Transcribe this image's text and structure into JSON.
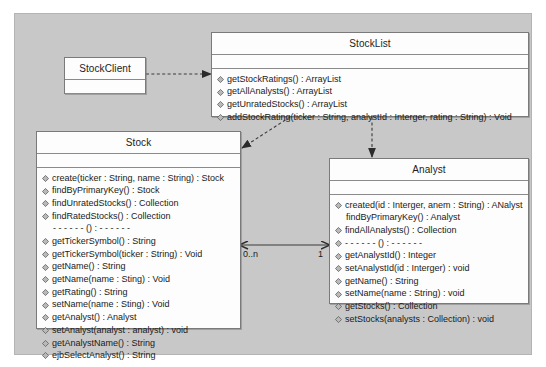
{
  "diagram": {
    "type": "uml-class-diagram",
    "canvas_color": "#c8c8c8",
    "class_fill_color": "#fdfdfd",
    "border_color": "#7a7a7a",
    "line_color": "#4a4a4a"
  },
  "classes": {
    "stock_client": {
      "name": "StockClient",
      "attributes": [],
      "operations": []
    },
    "stock_list": {
      "name": "StockList",
      "attributes": [],
      "operations": [
        {
          "icon": "public-method-icon",
          "label": "getStockRatings() : ArrayList"
        },
        {
          "icon": "public-method-icon",
          "label": "getAllAnalysts() : ArrayList"
        },
        {
          "icon": "public-method-icon",
          "label": "getUnratedStocks() : ArrayList"
        },
        {
          "icon": "public-method-icon",
          "label": "addStockRating(ticker : String, analystId : Interger, rating : String) : Void"
        }
      ]
    },
    "stock": {
      "name": "Stock",
      "attributes": [],
      "operations": [
        {
          "icon": "public-method-icon",
          "label": "create(ticker : String, name : String) : Stock"
        },
        {
          "icon": "public-method-icon",
          "label": "findByPrimaryKey() : Stock"
        },
        {
          "icon": "public-method-icon",
          "label": "findUnratedStocks() : Collection"
        },
        {
          "icon": "public-method-icon",
          "label": "findRatedStocks() : Collection"
        },
        {
          "icon": "none",
          "label": "- - - - - - () : - - - - - -"
        },
        {
          "icon": "public-method-icon",
          "label": "getTickerSymbol() : String"
        },
        {
          "icon": "public-method-icon",
          "label": "getTickerSymbol(ticker : String) : Void"
        },
        {
          "icon": "public-method-icon",
          "label": "getName() : String"
        },
        {
          "icon": "public-method-icon",
          "label": "getName(name : Sting) : Void"
        },
        {
          "icon": "public-method-icon",
          "label": "getRating() : String"
        },
        {
          "icon": "public-method-icon",
          "label": "setName(name : Sting) : Void"
        },
        {
          "icon": "public-method-icon",
          "label": "getAnalyst() : Analyst"
        },
        {
          "icon": "public-method-icon",
          "label": "setAnalyst(analyst : analyst) : void"
        },
        {
          "icon": "public-method-icon",
          "label": "getAnalystName() : String"
        },
        {
          "icon": "public-method-icon",
          "label": "ejbSelectAnalyst() : String"
        }
      ]
    },
    "analyst": {
      "name": "Analyst",
      "attributes": [],
      "operations": [
        {
          "icon": "public-method-icon",
          "label": "created(id : Interger, anem : String) : ANalyst"
        },
        {
          "icon": "none",
          "label": "findByPrimaryKey() : Analyst"
        },
        {
          "icon": "public-method-icon",
          "label": "findAllAnalysts() : Collection"
        },
        {
          "icon": "public-method-icon",
          "label": "- - - - - - () : - - - - - -"
        },
        {
          "icon": "public-method-icon",
          "label": "getAnalystId() : Integer"
        },
        {
          "icon": "public-method-icon",
          "label": "setAnalystId(id : Interger) : void"
        },
        {
          "icon": "public-method-icon",
          "label": "getName() : String"
        },
        {
          "icon": "public-method-icon",
          "label": "setName(name : String) : void"
        },
        {
          "icon": "public-method-icon",
          "label": "getStocks() : Collection"
        },
        {
          "icon": "public-method-icon",
          "label": "setStocks(analysts : Collection) : void"
        }
      ]
    }
  },
  "relationships": {
    "client_to_list": {
      "style": "dependency-dashed-arrow"
    },
    "list_to_stock": {
      "style": "dependency-dashed-arrow"
    },
    "list_to_analyst": {
      "style": "dependency-dashed-arrow"
    },
    "stock_to_analyst": {
      "style": "association-bidirectional",
      "source_multiplicity": "0..n",
      "target_multiplicity": "1"
    }
  }
}
